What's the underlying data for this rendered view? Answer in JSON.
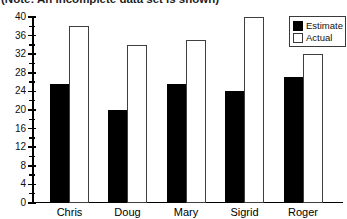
{
  "note": "(Note: An incomplete data set is shown)",
  "legend": {
    "items": [
      {
        "label": "Estimate",
        "swatch": "black"
      },
      {
        "label": "Actual",
        "swatch": "white"
      }
    ]
  },
  "colors": {
    "bar_fill_estimate": "#000000",
    "bar_fill_actual": "#ffffff",
    "bar_outline": "#3f3f3f",
    "axis": "#000000",
    "text": "#111111",
    "background": "#ffffff"
  },
  "chart_data": {
    "type": "bar",
    "title": "",
    "xlabel": "",
    "ylabel": "",
    "annotation": "(Note: An incomplete data set is shown)",
    "categories": [
      "Chris",
      "Doug",
      "Mary",
      "Sigrid",
      "Roger"
    ],
    "series": [
      {
        "name": "Estimate",
        "values": [
          25.5,
          20,
          25.5,
          24,
          27
        ]
      },
      {
        "name": "Actual",
        "values": [
          38,
          34,
          35,
          40,
          32
        ]
      }
    ],
    "ylim": [
      0,
      40
    ],
    "ytick_major": 4,
    "ytick_minor": 2,
    "ytick_labels": [
      "0",
      "4",
      "8",
      "12",
      "16",
      "20",
      "24",
      "28",
      "32",
      "36",
      "40"
    ],
    "grid": false,
    "legend_position": "top-right"
  }
}
